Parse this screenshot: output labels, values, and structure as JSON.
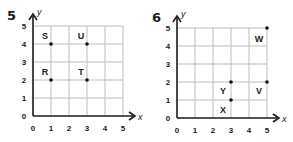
{
  "chart_data": [
    {
      "type": "scatter",
      "title": "5",
      "xlabel": "x",
      "ylabel": "y",
      "xlim": [
        0,
        5
      ],
      "ylim": [
        0,
        5
      ],
      "grid": true,
      "x_ticks": [
        "0",
        "1",
        "2",
        "3",
        "4",
        "5"
      ],
      "y_ticks": [
        "0",
        "1",
        "2",
        "3",
        "4",
        "5"
      ],
      "points": [
        {
          "label": "S",
          "x": 1,
          "y": 4
        },
        {
          "label": "U",
          "x": 3,
          "y": 4
        },
        {
          "label": "R",
          "x": 1,
          "y": 2
        },
        {
          "label": "T",
          "x": 3,
          "y": 2
        }
      ]
    },
    {
      "type": "scatter",
      "title": "6",
      "xlabel": "x",
      "ylabel": "y",
      "xlim": [
        0,
        5
      ],
      "ylim": [
        0,
        5
      ],
      "grid": true,
      "x_ticks": [
        "0",
        "1",
        "2",
        "3",
        "4",
        "5"
      ],
      "y_ticks": [
        "0",
        "1",
        "2",
        "3",
        "4",
        "5"
      ],
      "points": [
        {
          "label": "W",
          "x": 5,
          "y": 5
        },
        {
          "label": "Y",
          "x": 3,
          "y": 2
        },
        {
          "label": "V",
          "x": 5,
          "y": 2
        },
        {
          "label": "X",
          "x": 3,
          "y": 1
        }
      ]
    }
  ],
  "colors": {
    "axis": "#1a1a1a",
    "grid": "#bdbdbd",
    "point": "#111111",
    "text": "#1a1a1a"
  }
}
